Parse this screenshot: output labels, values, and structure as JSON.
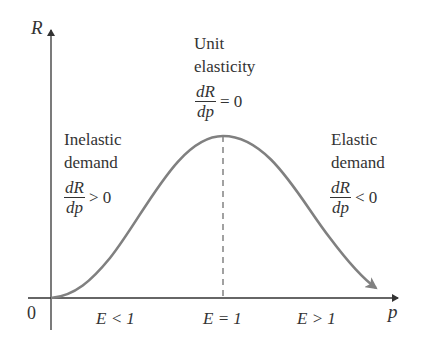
{
  "diagram": {
    "axes": {
      "y_label": "R",
      "x_label": "p",
      "origin_label": "0"
    },
    "regions": [
      {
        "heading_line1": "Inelastic",
        "heading_line2": "demand",
        "num": "dR",
        "den": "dp",
        "relation": "> 0",
        "elasticity": "E < 1"
      },
      {
        "heading_line1": "Unit",
        "heading_line2": "elasticity",
        "num": "dR",
        "den": "dp",
        "relation": "= 0",
        "elasticity": "E = 1"
      },
      {
        "heading_line1": "Elastic",
        "heading_line2": "demand",
        "num": "dR",
        "den": "dp",
        "relation": "< 0",
        "elasticity": "E > 1"
      }
    ],
    "colors": {
      "curve": "#808080",
      "axes": "#333333",
      "dashed": "#555555"
    }
  }
}
